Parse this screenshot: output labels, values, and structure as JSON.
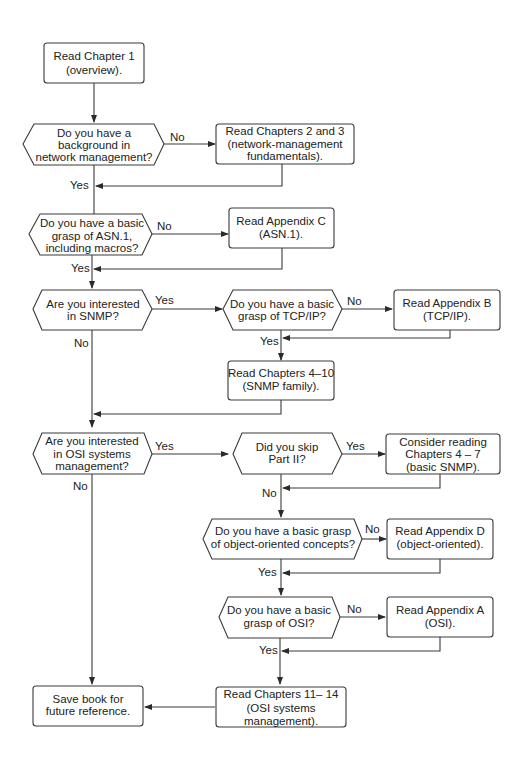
{
  "diagram": {
    "type": "flowchart",
    "nodes": {
      "start": {
        "shape": "process",
        "lines": [
          "Read Chapter 1",
          "(overview)."
        ]
      },
      "q_netmgmt": {
        "shape": "decision",
        "lines": [
          "Do you have a",
          "background in",
          "network management?"
        ]
      },
      "r_ch2_3": {
        "shape": "process",
        "lines": [
          "Read Chapters 2 and 3",
          "(network-management",
          "fundamentals)."
        ]
      },
      "q_asn1": {
        "shape": "decision",
        "lines": [
          "Do you have a basic",
          "grasp of ASN.1,",
          "including macros?"
        ]
      },
      "r_appC": {
        "shape": "process",
        "lines": [
          "Read Appendix C",
          "(ASN.1)."
        ]
      },
      "q_snmp": {
        "shape": "decision",
        "lines": [
          "Are you interested",
          "in SNMP?"
        ]
      },
      "q_tcpip": {
        "shape": "decision",
        "lines": [
          "Do you have a basic",
          "grasp of TCP/IP?"
        ]
      },
      "r_appB": {
        "shape": "process",
        "lines": [
          "Read Appendix B",
          "(TCP/IP)."
        ]
      },
      "r_ch4_10": {
        "shape": "process",
        "lines": [
          "Read Chapters 4–10",
          "(SNMP family)."
        ]
      },
      "q_osi_mgmt": {
        "shape": "decision",
        "lines": [
          "Are you interested",
          "in OSI systems",
          "management?"
        ]
      },
      "q_skip2": {
        "shape": "decision",
        "lines": [
          "Did you skip",
          "Part II?"
        ]
      },
      "r_ch4_7": {
        "shape": "process",
        "lines": [
          "Consider reading",
          "Chapters 4 – 7",
          "(basic SNMP)."
        ]
      },
      "q_oo": {
        "shape": "decision",
        "lines": [
          "Do you have a basic grasp",
          "of object-oriented concepts?"
        ]
      },
      "r_appD": {
        "shape": "process",
        "lines": [
          "Read Appendix D",
          "(object-oriented)."
        ]
      },
      "q_osi": {
        "shape": "decision",
        "lines": [
          "Do you have a basic",
          "grasp of OSI?"
        ]
      },
      "r_appA": {
        "shape": "process",
        "lines": [
          "Read Appendix A",
          "(OSI)."
        ]
      },
      "r_ch11_14": {
        "shape": "process",
        "lines": [
          "Read Chapters 11– 14",
          "(OSI systems",
          "management)."
        ]
      },
      "end": {
        "shape": "process",
        "lines": [
          "Save book for",
          "future reference."
        ]
      }
    },
    "labels": {
      "no": "No",
      "yes": "Yes"
    },
    "edges": [
      {
        "from": "start",
        "to": "q_netmgmt",
        "label": ""
      },
      {
        "from": "q_netmgmt",
        "to": "r_ch2_3",
        "label": "No"
      },
      {
        "from": "q_netmgmt",
        "to": "q_asn1",
        "label": "Yes"
      },
      {
        "from": "r_ch2_3",
        "to": "q_asn1",
        "label": ""
      },
      {
        "from": "q_asn1",
        "to": "r_appC",
        "label": "No"
      },
      {
        "from": "q_asn1",
        "to": "q_snmp",
        "label": "Yes"
      },
      {
        "from": "r_appC",
        "to": "q_snmp",
        "label": ""
      },
      {
        "from": "q_snmp",
        "to": "q_tcpip",
        "label": "Yes"
      },
      {
        "from": "q_snmp",
        "to": "q_osi_mgmt",
        "label": "No"
      },
      {
        "from": "q_tcpip",
        "to": "r_appB",
        "label": "No"
      },
      {
        "from": "q_tcpip",
        "to": "r_ch4_10",
        "label": "Yes"
      },
      {
        "from": "r_appB",
        "to": "r_ch4_10",
        "label": ""
      },
      {
        "from": "r_ch4_10",
        "to": "q_osi_mgmt",
        "label": ""
      },
      {
        "from": "q_osi_mgmt",
        "to": "q_skip2",
        "label": "Yes"
      },
      {
        "from": "q_osi_mgmt",
        "to": "end",
        "label": "No"
      },
      {
        "from": "q_skip2",
        "to": "r_ch4_7",
        "label": "Yes"
      },
      {
        "from": "q_skip2",
        "to": "q_oo",
        "label": "No"
      },
      {
        "from": "r_ch4_7",
        "to": "q_oo",
        "label": ""
      },
      {
        "from": "q_oo",
        "to": "r_appD",
        "label": "No"
      },
      {
        "from": "q_oo",
        "to": "q_osi",
        "label": "Yes"
      },
      {
        "from": "r_appD",
        "to": "q_osi",
        "label": ""
      },
      {
        "from": "q_osi",
        "to": "r_appA",
        "label": "No"
      },
      {
        "from": "q_osi",
        "to": "r_ch11_14",
        "label": "Yes"
      },
      {
        "from": "r_appA",
        "to": "r_ch11_14",
        "label": ""
      },
      {
        "from": "r_ch11_14",
        "to": "end",
        "label": ""
      }
    ]
  }
}
